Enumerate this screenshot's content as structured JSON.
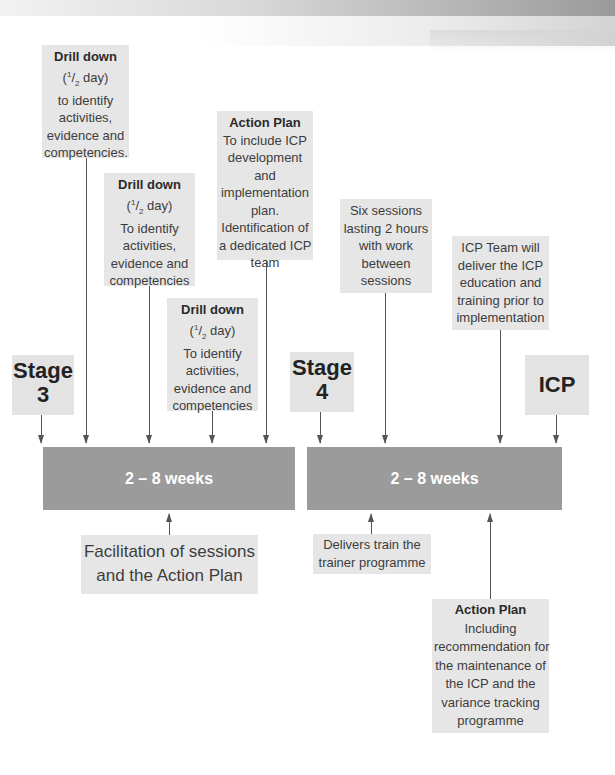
{
  "top_notes": {
    "drill_down_1": {
      "title": "Drill down",
      "duration": "(1/2 day)",
      "lines": [
        "to identify",
        "activities,",
        "evidence and",
        "competencies."
      ]
    },
    "drill_down_2": {
      "title": "Drill down",
      "duration": "(1/2 day)",
      "lines": [
        "To identify",
        "activities,",
        "evidence and",
        "competencies"
      ]
    },
    "drill_down_3": {
      "title": "Drill down",
      "duration": "(1/2 day)",
      "lines": [
        "To identify",
        "activities,",
        "evidence and",
        "competencies"
      ]
    },
    "action_plan_1": {
      "title": "Action Plan",
      "lines": [
        "To include ICP",
        "development",
        "and",
        "implementation",
        "plan.",
        "Identification of",
        "a dedicated ICP",
        "team"
      ]
    },
    "six_sessions": {
      "lines": [
        "Six sessions",
        "lasting 2 hours",
        "with work",
        "between",
        "sessions"
      ]
    },
    "icp_team": {
      "lines": [
        "ICP Team will",
        "deliver the ICP",
        "education and",
        "training prior to",
        "implementation"
      ]
    }
  },
  "stages": {
    "stage3": {
      "line1": "Stage",
      "line2": "3"
    },
    "stage4": {
      "line1": "Stage",
      "line2": "4"
    },
    "icp": {
      "line1": "ICP"
    }
  },
  "bars": {
    "left": {
      "label": "2 – 8 weeks"
    },
    "right": {
      "label": "2 – 8 weeks"
    }
  },
  "bottom_notes": {
    "facilitation": {
      "lines": [
        "Facilitation of sessions",
        "and the Action Plan"
      ]
    },
    "delivers": {
      "lines": [
        "Delivers train the",
        "trainer programme"
      ]
    },
    "action_plan_2": {
      "title": "Action Plan",
      "lines": [
        "Including",
        "recommendation for",
        "the maintenance of",
        "the ICP and the",
        "variance tracking",
        "programme"
      ]
    }
  },
  "colors": {
    "bar": "#9b9b9b",
    "box": "#e6e6e6",
    "arrow": "#555555"
  }
}
